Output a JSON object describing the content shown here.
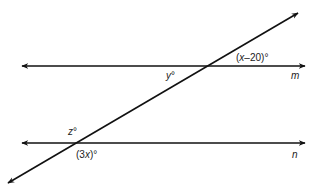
{
  "diagram": {
    "type": "geometry-parallel-lines-transversal",
    "colors": {
      "line": "#111111",
      "text": "#222222",
      "background": "#ffffff"
    },
    "lines": [
      {
        "id": "m",
        "label": "m",
        "y": 66,
        "x1": 22,
        "x2": 305
      },
      {
        "id": "n",
        "label": "n",
        "y": 143,
        "x1": 22,
        "x2": 305
      }
    ],
    "transversal": {
      "x1": 8,
      "y1": 183,
      "x2": 298,
      "y2": 13
    },
    "angle_labels": {
      "top_right_m": "(x–20)°",
      "bottom_left_m": "y°",
      "top_left_n": "z°",
      "bottom_right_n": "(3x)°"
    }
  }
}
